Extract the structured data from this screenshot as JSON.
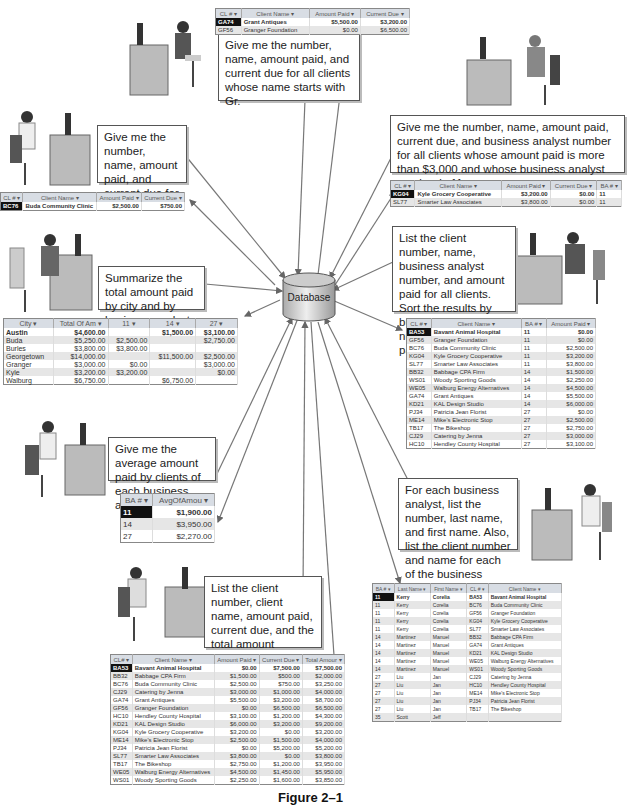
{
  "center": {
    "label": "Database"
  },
  "caption": "Figure 2–1",
  "queries": [
    {
      "id": "q1",
      "text": "Give me the number, name, amount paid, and current due for all clients whose name starts with Gr."
    },
    {
      "id": "q2",
      "text": "Give me the number, name, amount paid, and current due for client BC76."
    },
    {
      "id": "q3",
      "text": "Give me the number, name, amount paid, current due, and business analyst number for all clients whose amount paid is more than $3,000 and whose business analyst number is 11."
    },
    {
      "id": "q4",
      "text": "Summarize the total amount paid by city and by business analyst."
    },
    {
      "id": "q5",
      "text": "List the client number, name, business analyst number, and amount paid for all clients. Sort the results by business analyst number and amount paid."
    },
    {
      "id": "q6",
      "text": "Give me the average amount paid by clients of each business analyst."
    },
    {
      "id": "q7",
      "text": "For each business analyst, list the number, last name, and first name. Also, list the client number and name for each of the business analyst's clients."
    },
    {
      "id": "q8",
      "text": "List the client number, client name, amount paid, current due, and the total amount (amount paid plus current due) for each client."
    }
  ],
  "tables": {
    "t1": {
      "headers": [
        "CL # ▾",
        "Client Name ▾",
        "Amount Paid ▾",
        "Current Due ▾"
      ],
      "rows": [
        [
          "GA74",
          "Grant Antiques",
          "$5,500.00",
          "$3,200.00"
        ],
        [
          "GF56",
          "Granger Foundation",
          "$0.00",
          "$6,500.00"
        ]
      ]
    },
    "t2": {
      "headers": [
        "CL # ▾",
        "Client Name ▾",
        "Amount Paid ▾",
        "Current Due ▾"
      ],
      "rows": [
        [
          "BC76",
          "Buda Community Clinic",
          "$2,500.00",
          "$750.00"
        ]
      ]
    },
    "t3": {
      "headers": [
        "CL # ▾",
        "Client Name ▾",
        "Amount Paid ▾",
        "Current Due ▾",
        "BA # ▾"
      ],
      "rows": [
        [
          "KG04",
          "Kyle Grocery Cooperative",
          "$3,200.00",
          "$0.00",
          "11"
        ],
        [
          "SL77",
          "Smarter Law Associates",
          "$3,800.00",
          "$0.00",
          "11"
        ]
      ]
    },
    "t4": {
      "headers": [
        "City ▾",
        "Total Of Am ▾",
        "11 ▾",
        "14 ▾",
        "27 ▾"
      ],
      "rows": [
        [
          "Austin",
          "$4,600.00",
          "",
          "$1,500.00",
          "$3,100.00"
        ],
        [
          "Buda",
          "$5,250.00",
          "$2,500.00",
          "",
          "$2,750.00"
        ],
        [
          "Burles",
          "$3,800.00",
          "$3,800.00",
          "",
          ""
        ],
        [
          "Georgetown",
          "$14,000.00",
          "",
          "$11,500.00",
          "$2,500.00"
        ],
        [
          "Granger",
          "$3,000.00",
          "$0.00",
          "",
          "$3,000.00"
        ],
        [
          "Kyle",
          "$3,200.00",
          "$3,200.00",
          "",
          "$0.00"
        ],
        [
          "Walburg",
          "$6,750.00",
          "",
          "$6,750.00",
          ""
        ]
      ]
    },
    "t5": {
      "headers": [
        "CL # ▾",
        "Client Name ▾",
        "BA # ▾",
        "Amount Paid ▾"
      ],
      "rows": [
        [
          "BA53",
          "Bavant Animal Hospital",
          "11",
          "$0.00"
        ],
        [
          "GF56",
          "Granger Foundation",
          "11",
          "$0.00"
        ],
        [
          "BC76",
          "Buda Community Clinic",
          "11",
          "$2,500.00"
        ],
        [
          "KG04",
          "Kyle Grocery Cooperative",
          "11",
          "$3,200.00"
        ],
        [
          "SL77",
          "Smarter Law Associates",
          "11",
          "$3,800.00"
        ],
        [
          "BB32",
          "Babbage CPA Firm",
          "14",
          "$1,500.00"
        ],
        [
          "WS01",
          "Woody Sporting Goods",
          "14",
          "$2,250.00"
        ],
        [
          "WE05",
          "Walburg Energy Alternatives",
          "14",
          "$4,500.00"
        ],
        [
          "GA74",
          "Grant Antiques",
          "14",
          "$5,500.00"
        ],
        [
          "KD21",
          "KAL Design Studio",
          "14",
          "$6,000.00"
        ],
        [
          "PJ34",
          "Patricia Jean Florist",
          "27",
          "$0.00"
        ],
        [
          "ME14",
          "Mike's Electronic Stop",
          "27",
          "$2,500.00"
        ],
        [
          "TB17",
          "The Bikeshop",
          "27",
          "$2,750.00"
        ],
        [
          "CJ29",
          "Catering by Jenna",
          "27",
          "$3,000.00"
        ],
        [
          "HC10",
          "Hendley County Hospital",
          "27",
          "$3,100.00"
        ]
      ]
    },
    "t6": {
      "headers": [
        "BA # ▾",
        "AvgOfAmou ▾"
      ],
      "rows": [
        [
          "11",
          "$1,900.00"
        ],
        [
          "14",
          "$3,950.00"
        ],
        [
          "27",
          "$2,270.00"
        ]
      ]
    },
    "t7": {
      "headers": [
        "BA # ▾",
        "Last Name ▾",
        "First Name ▾",
        "CL # ▾",
        "Client Name ▾"
      ],
      "rows": [
        [
          "11",
          "Kerry",
          "Corelia",
          "BA53",
          "Bavant Animal Hospital"
        ],
        [
          "11",
          "Kerry",
          "Corelia",
          "BC76",
          "Buda Community Clinic"
        ],
        [
          "11",
          "Kerry",
          "Corelia",
          "GF56",
          "Granger Foundation"
        ],
        [
          "11",
          "Kerry",
          "Corelia",
          "KG04",
          "Kyle Grocery Cooperative"
        ],
        [
          "11",
          "Kerry",
          "Corelia",
          "SL77",
          "Smarter Law Associates"
        ],
        [
          "14",
          "Martinez",
          "Manuel",
          "BB32",
          "Babbage CPA Firm"
        ],
        [
          "14",
          "Martinez",
          "Manuel",
          "GA74",
          "Grant Antiques"
        ],
        [
          "14",
          "Martinez",
          "Manuel",
          "KD21",
          "KAL Design Studio"
        ],
        [
          "14",
          "Martinez",
          "Manuel",
          "WE05",
          "Walburg Energy Alternatives"
        ],
        [
          "14",
          "Martinez",
          "Manuel",
          "WS01",
          "Woody Sporting Goods"
        ],
        [
          "27",
          "Liu",
          "Jan",
          "CJ29",
          "Catering by Jenna"
        ],
        [
          "27",
          "Liu",
          "Jan",
          "HC10",
          "Hendley County Hospital"
        ],
        [
          "27",
          "Liu",
          "Jan",
          "ME14",
          "Mike's Electronic Stop"
        ],
        [
          "27",
          "Liu",
          "Jan",
          "PJ34",
          "Patricia Jean Florist"
        ],
        [
          "27",
          "Liu",
          "Jan",
          "TB17",
          "The Bikeshop"
        ],
        [
          "35",
          "Scott",
          "Jeff",
          "",
          ""
        ]
      ]
    },
    "t8": {
      "headers": [
        "CL# ▾",
        "Client Name ▾",
        "Amount Paid ▾",
        "Current Due ▾",
        "Total Amour ▾"
      ],
      "rows": [
        [
          "BA53",
          "Bavant Animal Hospital",
          "$0.00",
          "$7,500.00",
          "$7,500.00"
        ],
        [
          "BB32",
          "Babbage CPA Firm",
          "$1,500.00",
          "$500.00",
          "$2,000.00"
        ],
        [
          "BC76",
          "Buda Community Clinic",
          "$2,500.00",
          "$750.00",
          "$3,250.00"
        ],
        [
          "CJ29",
          "Catering by Jenna",
          "$3,000.00",
          "$1,000.00",
          "$4,000.00"
        ],
        [
          "GA74",
          "Grant Antiques",
          "$5,500.00",
          "$3,200.00",
          "$8,700.00"
        ],
        [
          "GF56",
          "Granger Foundation",
          "$0.00",
          "$6,500.00",
          "$6,500.00"
        ],
        [
          "HC10",
          "Hendley County Hospital",
          "$3,100.00",
          "$1,200.00",
          "$4,300.00"
        ],
        [
          "KD21",
          "KAL Design Studio",
          "$6,000.00",
          "$3,200.00",
          "$9,200.00"
        ],
        [
          "KG04",
          "Kyle Grocery Cooperative",
          "$3,200.00",
          "$0.00",
          "$3,200.00"
        ],
        [
          "ME14",
          "Mike's Electronic Stop",
          "$2,500.00",
          "$1,500.00",
          "$4,000.00"
        ],
        [
          "PJ34",
          "Patricia Jean Florist",
          "$0.00",
          "$5,200.00",
          "$5,200.00"
        ],
        [
          "SL77",
          "Smarter Law Associates",
          "$3,800.00",
          "$0.00",
          "$3,800.00"
        ],
        [
          "TB17",
          "The Bikeshop",
          "$2,750.00",
          "$1,200.00",
          "$3,950.00"
        ],
        [
          "WE05",
          "Walburg Energy Alternatives",
          "$4,500.00",
          "$1,450.00",
          "$5,950.00"
        ],
        [
          "WS01",
          "Woody Sporting Goods",
          "$2,250.00",
          "$1,600.00",
          "$3,850.00"
        ]
      ]
    }
  }
}
